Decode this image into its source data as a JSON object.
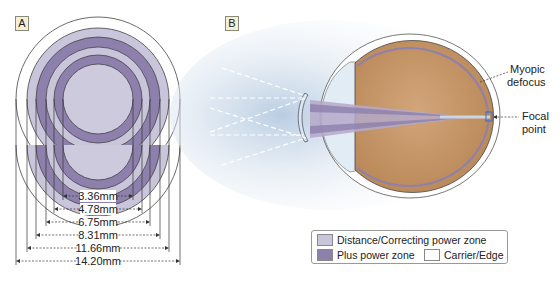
{
  "panels": {
    "a": {
      "label": "A",
      "dimensions": [
        "3.36mm",
        "4.78mm",
        "6.75mm",
        "8.31mm",
        "11.66mm",
        "14.20mm"
      ]
    },
    "b": {
      "label": "B",
      "annotations": {
        "myopic_line1": "Myopic",
        "myopic_line2": "defocus",
        "focal_line1": "Focal",
        "focal_line2": "point"
      }
    }
  },
  "legend": {
    "distance": "Distance/Correcting power zone",
    "plus": "Plus power zone",
    "carrier": "Carrier/Edge"
  },
  "colors": {
    "distance_zone": "#c9c5db",
    "plus_zone": "#8e80ad",
    "carrier": "#ffffff",
    "eye_interior": "#c99a6c",
    "cornea": "#dce8f2"
  }
}
